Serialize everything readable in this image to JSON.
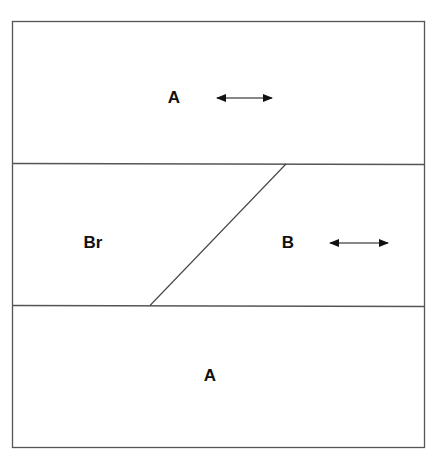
{
  "diagram": {
    "layers": [
      {
        "id": "top",
        "label": "A",
        "has_arrow": true
      },
      {
        "id": "middle-left",
        "label": "Br",
        "has_arrow": false
      },
      {
        "id": "middle-right",
        "label": "B",
        "has_arrow": true
      },
      {
        "id": "bottom",
        "label": "A",
        "has_arrow": false
      }
    ],
    "arrow_icon": "double-headed-horizontal-arrow",
    "line_color": "#555555"
  }
}
